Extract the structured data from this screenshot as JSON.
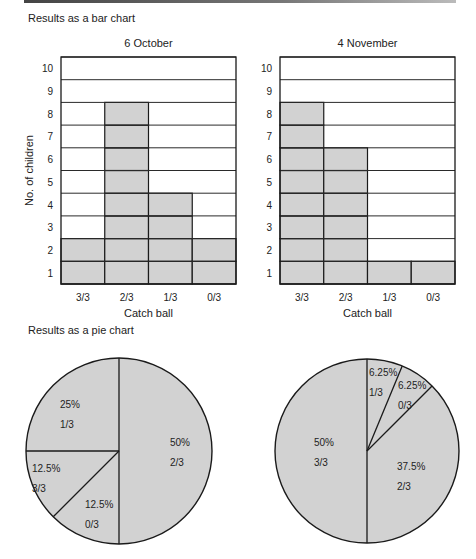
{
  "bar_section": {
    "title": "Results as a bar chart"
  },
  "pie_section": {
    "title": "Results as a pie chart"
  },
  "colors": {
    "fill": "#d2d2d2",
    "stroke": "#1a1a1a",
    "grid": "#2a2a2a"
  },
  "chart_data": [
    {
      "type": "bar",
      "title": "6 October",
      "xlabel": "Catch ball",
      "ylabel": "No. of children",
      "categories": [
        "3/3",
        "2/3",
        "1/3",
        "0/3"
      ],
      "values": [
        2,
        8,
        4,
        2
      ],
      "ylim": [
        0,
        10
      ],
      "yticks": [
        1,
        2,
        3,
        4,
        5,
        6,
        7,
        8,
        9,
        10
      ],
      "grid": true
    },
    {
      "type": "bar",
      "title": "4 November",
      "xlabel": "Catch ball",
      "ylabel": "",
      "categories": [
        "3/3",
        "2/3",
        "1/3",
        "0/3"
      ],
      "values": [
        8,
        6,
        1,
        1
      ],
      "ylim": [
        0,
        10
      ],
      "yticks": [
        1,
        2,
        3,
        4,
        5,
        6,
        7,
        8,
        9,
        10
      ],
      "grid": true
    },
    {
      "type": "pie",
      "title": "6 October",
      "slices": [
        {
          "label": "2/3",
          "percent": "50%",
          "value": 50
        },
        {
          "label": "0/3",
          "percent": "12.5%",
          "value": 12.5
        },
        {
          "label": "3/3",
          "percent": "12.5%",
          "value": 12.5
        },
        {
          "label": "1/3",
          "percent": "25%",
          "value": 25
        }
      ]
    },
    {
      "type": "pie",
      "title": "4 November",
      "slices": [
        {
          "label": "1/3",
          "percent": "6.25%",
          "value": 6.25
        },
        {
          "label": "0/3",
          "percent": "6.25%",
          "value": 6.25
        },
        {
          "label": "2/3",
          "percent": "37.5%",
          "value": 37.5
        },
        {
          "label": "3/3",
          "percent": "50%",
          "value": 50
        }
      ]
    }
  ]
}
